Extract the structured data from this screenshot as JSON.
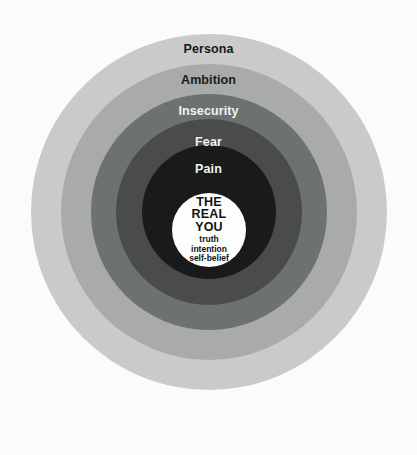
{
  "diagram": {
    "background_color": "#fbfbfa",
    "center_x": 208,
    "center_y": 212,
    "rings": [
      {
        "label": "Persona",
        "color": "#c9cbca",
        "text_color": "#17191a",
        "diameter": 356,
        "order": 1
      },
      {
        "label": "Ambition",
        "color": "#a9abaa",
        "text_color": "#17191a",
        "diameter": 296,
        "order": 2
      },
      {
        "label": "Insecurity",
        "color": "#6d7170",
        "text_color": "#f2f3f1",
        "diameter": 236,
        "order": 3
      },
      {
        "label": "Fear",
        "color": "#494c4b",
        "text_color": "#f2f3f1",
        "diameter": 186,
        "order": 4
      },
      {
        "label": "Pain",
        "color": "#191b1a",
        "text_color": "#f2f3f1",
        "diameter": 134,
        "order": 5
      }
    ],
    "core": {
      "color": "#fdfdfb",
      "diameter": 74,
      "heading_line_1": "THE",
      "heading_line_2": "REAL",
      "heading_line_3": "YOU",
      "sub_line_1": "truth",
      "sub_line_2": "intention",
      "sub_line_3": "self-belief"
    }
  }
}
